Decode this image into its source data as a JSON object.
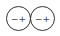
{
  "diagram": {
    "title": "",
    "elements": [
      {
        "type": "cell",
        "negative_label": "−",
        "positive_label": "+"
      },
      {
        "type": "cell",
        "negative_label": "−",
        "positive_label": "+"
      }
    ],
    "colors": {
      "stroke": "#333333",
      "text": "#444444",
      "background": "#ffffff"
    }
  }
}
